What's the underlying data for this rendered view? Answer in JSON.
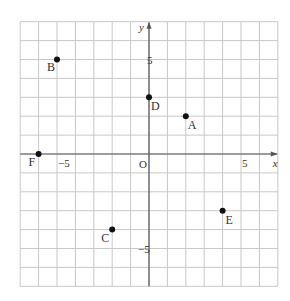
{
  "diagram": {
    "type": "coordinate-grid",
    "x_axis_label": "x",
    "y_axis_label": "y",
    "origin_label": "O",
    "x_range": [
      -7,
      7
    ],
    "y_range": [
      -7,
      7
    ],
    "grid_step": 1,
    "tick_labels": {
      "x": [
        {
          "value": -5,
          "label": "−5"
        },
        {
          "value": 5,
          "label": "5"
        }
      ],
      "y": [
        {
          "value": 5,
          "label": "5"
        },
        {
          "value": -5,
          "label": "−5"
        }
      ]
    },
    "points": [
      {
        "name": "A",
        "x": 2,
        "y": 2
      },
      {
        "name": "B",
        "x": -5,
        "y": 5
      },
      {
        "name": "C",
        "x": -2,
        "y": -4
      },
      {
        "name": "D",
        "x": 0,
        "y": 3
      },
      {
        "name": "E",
        "x": 4,
        "y": -3
      },
      {
        "name": "F",
        "x": -6,
        "y": 0
      }
    ],
    "colors": {
      "grid": "#c8c8c8",
      "axis": "#555555",
      "point": "#111111",
      "text": "#333333"
    }
  }
}
